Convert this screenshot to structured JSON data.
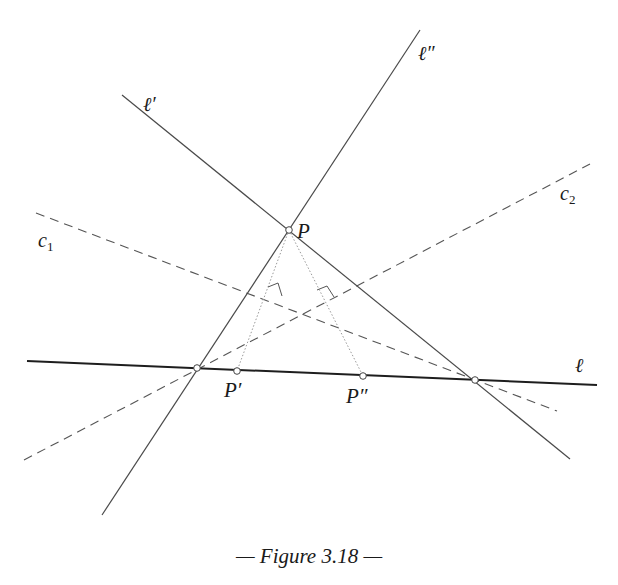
{
  "figure": {
    "caption": "— Figure 3.18 —",
    "colors": {
      "line": "#4a4a4a",
      "thick_line": "#1e1e1e",
      "dashed": "#555555",
      "dotted": "#9a9a9a",
      "point_fill": "#ffffff",
      "point_stroke": "#444444"
    },
    "lines": {
      "l": {
        "label": "ℓ",
        "from": [
          27,
          361
        ],
        "to": [
          597,
          385
        ],
        "style": "solid-thick"
      },
      "l_prime": {
        "label": "ℓ′",
        "from": [
          122,
          95
        ],
        "to": [
          570,
          459
        ],
        "style": "solid"
      },
      "l_double_prime": {
        "label": "ℓ″",
        "from": [
          420,
          30
        ],
        "to": [
          102,
          515
        ],
        "style": "solid"
      },
      "c1": {
        "label": "c",
        "subscript": "1",
        "from": [
          36,
          213
        ],
        "to": [
          557,
          411
        ],
        "style": "dashed"
      },
      "c2": {
        "label": "c",
        "subscript": "2",
        "from": [
          24,
          460
        ],
        "to": [
          590,
          164
        ],
        "style": "dashed"
      }
    },
    "points": {
      "P": {
        "label": "P",
        "at": [
          289,
          230
        ]
      },
      "P_prime": {
        "label": "P′",
        "at": [
          237,
          371
        ]
      },
      "P_double_prime": {
        "label": "P″",
        "at": [
          363,
          376
        ]
      },
      "X_left": {
        "label": "",
        "at": [
          197,
          368
        ]
      },
      "X_right": {
        "label": "",
        "at": [
          475,
          380
        ]
      }
    },
    "perpendiculars": [
      {
        "from": "P",
        "to": "P_prime",
        "style": "dotted"
      },
      {
        "from": "P",
        "to": "P_double_prime",
        "style": "dotted"
      }
    ]
  }
}
